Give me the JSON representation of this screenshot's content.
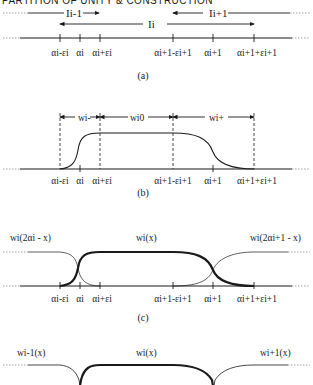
{
  "header": {
    "text": "PARTITION OF UNITY & CONSTRUCTION"
  },
  "ticks": {
    "a_minus": "αi-εi",
    "a": "αi",
    "a_plus": "αi+εi",
    "b_minus": "αi+1-εi+1",
    "b": "αi+1",
    "b_plus": "αi+1+εi+1"
  },
  "panel_a": {
    "caption": "(a)",
    "interval_prev": "Ii-1",
    "interval_curr": "Ii",
    "interval_next": "Ii+1"
  },
  "panel_b": {
    "caption": "(b)",
    "w_minus": "wi-",
    "w_zero": "wi0",
    "w_plus": "wi+"
  },
  "panel_c": {
    "caption": "(c)",
    "left_fn": "wi(2αi - x)",
    "center_fn": "wi(x)",
    "right_fn": "wi(2αi+1 - x)"
  },
  "panel_d": {
    "left_fn": "wi-1(x)",
    "center_fn": "wi(x)",
    "right_fn": "wi+1(x)"
  },
  "colors": {
    "ink": "#1a1a1a",
    "background": "#ffffff"
  }
}
